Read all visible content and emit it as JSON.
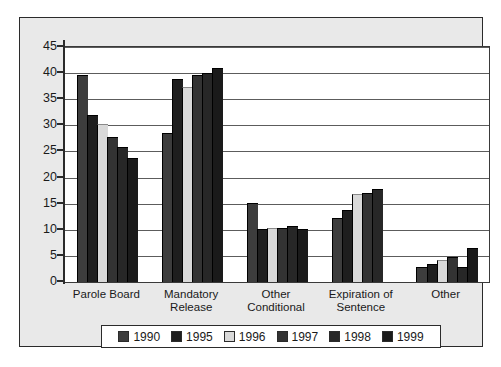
{
  "chart_data": {
    "type": "bar",
    "title": "",
    "xlabel": "",
    "ylabel": "",
    "ylim": [
      0,
      45
    ],
    "ytick_step": 5,
    "grid": true,
    "legend_position": "bottom",
    "categories": [
      "Parole Board",
      "Mandatory Release",
      "Other Conditional",
      "Expiration of Sentence",
      "Other"
    ],
    "category_lines": [
      [
        "Parole Board"
      ],
      [
        "Mandatory",
        "Release"
      ],
      [
        "Other",
        "Conditional"
      ],
      [
        "Expiration of",
        "Sentence"
      ],
      [
        "Other"
      ]
    ],
    "ytick_labels": [
      "45",
      "40",
      "35",
      "30",
      "25",
      "20",
      "15",
      "10",
      "5",
      "0"
    ],
    "ytick_values": [
      45,
      40,
      35,
      30,
      25,
      20,
      15,
      10,
      5,
      0
    ],
    "series": [
      {
        "name": "1990",
        "color": "#3d3d3d",
        "values": [
          39.7,
          28.5,
          15.2,
          12.2,
          2.8
        ]
      },
      {
        "name": "1995",
        "color": "#1e1e1e",
        "values": [
          31.9,
          38.8,
          10.1,
          13.8,
          3.5
        ]
      },
      {
        "name": "1996",
        "color": "#d9d9d9",
        "values": [
          30.3,
          37.4,
          10.4,
          16.8,
          4.2
        ]
      },
      {
        "name": "1997",
        "color": "#333333",
        "values": [
          27.7,
          39.6,
          10.4,
          17.0,
          4.8
        ]
      },
      {
        "name": "1998",
        "color": "#272727",
        "values": [
          25.9,
          40.1,
          10.8,
          17.8,
          2.8
        ]
      },
      {
        "name": "1999",
        "color": "#1a1a1a",
        "values": [
          23.8,
          40.9,
          10.1,
          0.0,
          6.5
        ]
      }
    ]
  },
  "legend": {
    "entries": [
      {
        "label": "1990",
        "color": "#3d3d3d"
      },
      {
        "label": "1995",
        "color": "#1e1e1e"
      },
      {
        "label": "1996",
        "color": "#d9d9d9"
      },
      {
        "label": "1997",
        "color": "#333333"
      },
      {
        "label": "1998",
        "color": "#272727"
      },
      {
        "label": "1999",
        "color": "#1a1a1a"
      }
    ]
  },
  "colors": {
    "panel_background": "#e9e9e9",
    "plot_background": "#ffffff",
    "frame": "#2b2b2b",
    "gridline": "#5c5c5c",
    "text": "#1a1a1a"
  }
}
